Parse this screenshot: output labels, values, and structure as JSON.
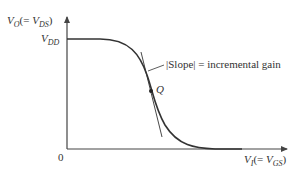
{
  "diagram": {
    "y_axis": {
      "symbol": "V",
      "subscript": "O",
      "paren_open": "(= ",
      "paren_symbol": "V",
      "paren_subscript": "DS",
      "paren_close": ")"
    },
    "x_axis": {
      "symbol": "V",
      "subscript": "I",
      "paren_open": "(= ",
      "paren_symbol": "V",
      "paren_subscript": "GS",
      "paren_close": ")"
    },
    "vdd_label": {
      "symbol": "V",
      "subscript": "DD"
    },
    "origin_label": "0",
    "q_point_label": "Q",
    "annotation": "|Slope| = incremental gain",
    "colors": {
      "curve": "#333333",
      "axis": "#444444",
      "background": "#ffffff"
    }
  }
}
